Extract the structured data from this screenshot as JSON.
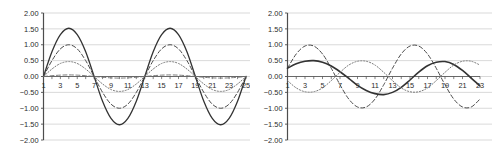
{
  "figure": {
    "background_color": "#ffffff",
    "panel_count": 2
  },
  "chart_data": [
    {
      "id": "left-chart",
      "type": "line",
      "title": "",
      "subtitle": "",
      "xlabel": "",
      "ylabel": "",
      "grid": true,
      "grid_axis": "y",
      "legend": "none",
      "xlim": [
        1,
        25
      ],
      "ylim": [
        -2.0,
        2.0
      ],
      "yticks": [
        2.0,
        1.5,
        1.0,
        0.5,
        0.0,
        -0.5,
        -1.0,
        -1.5,
        -2.0
      ],
      "ytick_labels": [
        "2.00",
        "1.50",
        "1.00",
        "0.50",
        "0.00",
        "-0.50",
        "-1.00",
        "-1.50",
        "-2.00"
      ],
      "xticks": [
        1,
        3,
        5,
        7,
        9,
        11,
        13,
        15,
        17,
        19,
        21,
        23,
        25
      ],
      "xtick_labels": [
        "1",
        "3",
        "5",
        "7",
        "9",
        "11",
        "13",
        "15",
        "17",
        "19",
        "21",
        "23",
        "25"
      ],
      "x": [
        1,
        2,
        3,
        4,
        5,
        6,
        7,
        8,
        9,
        10,
        11,
        12,
        13,
        14,
        15,
        16,
        17,
        18,
        19,
        20,
        21,
        22,
        23,
        24,
        25
      ],
      "series": [
        {
          "name": "series-1-solid",
          "style": "solid",
          "color": "#333333",
          "width": 1.3,
          "amplitude": 1.53,
          "values": [
            0.0,
            0.78,
            1.32,
            1.52,
            1.32,
            0.78,
            0.0,
            -0.78,
            -1.32,
            -1.52,
            -1.32,
            -0.78,
            0.0,
            0.78,
            1.32,
            1.52,
            1.32,
            0.78,
            0.0,
            -0.78,
            -1.32,
            -1.52,
            -1.32,
            -0.78,
            0.0
          ]
        },
        {
          "name": "series-2-dashed",
          "style": "dashed",
          "color": "#4a4a4a",
          "width": 1.0,
          "amplitude": 1.0,
          "values": [
            0.0,
            0.5,
            0.87,
            1.0,
            0.87,
            0.5,
            0.0,
            -0.5,
            -0.87,
            -1.0,
            -0.87,
            -0.5,
            0.0,
            0.5,
            0.87,
            1.0,
            0.87,
            0.5,
            0.0,
            -0.5,
            -0.87,
            -1.0,
            -0.87,
            -0.5,
            0.0
          ]
        },
        {
          "name": "series-3-dotted",
          "style": "dotted",
          "color": "#777777",
          "width": 1.0,
          "amplitude": 0.47,
          "values": [
            0.0,
            0.235,
            0.41,
            0.47,
            0.41,
            0.235,
            0.0,
            -0.235,
            -0.41,
            -0.47,
            -0.41,
            -0.235,
            0.0,
            0.235,
            0.41,
            0.47,
            0.41,
            0.235,
            0.0,
            -0.235,
            -0.41,
            -0.47,
            -0.41,
            -0.235,
            0.0
          ]
        },
        {
          "name": "series-4-flat-dashed",
          "style": "dashed",
          "color": "#6e6e6e",
          "width": 0.9,
          "amplitude": 0.05,
          "values": [
            0.0,
            0.025,
            0.043,
            0.05,
            0.043,
            0.025,
            0.0,
            -0.025,
            -0.043,
            -0.05,
            -0.043,
            -0.025,
            0.0,
            0.025,
            0.043,
            0.05,
            0.043,
            0.025,
            0.0,
            -0.025,
            -0.043,
            -0.05,
            -0.043,
            -0.025,
            0.0
          ]
        }
      ]
    },
    {
      "id": "right-chart",
      "type": "line",
      "title": "",
      "subtitle": "",
      "xlabel": "",
      "ylabel": "",
      "grid": true,
      "grid_axis": "y",
      "legend": "none",
      "xlim": [
        1,
        23
      ],
      "ylim": [
        -2.0,
        2.0
      ],
      "yticks": [
        2.0,
        1.5,
        1.0,
        0.5,
        0.0,
        -0.5,
        -1.0,
        -1.5,
        -2.0
      ],
      "ytick_labels": [
        "2.00",
        "1.50",
        "1.00",
        "0.50",
        "0.00",
        "-0.50",
        "-1.00",
        "-1.50",
        "-2.00"
      ],
      "xticks": [
        1,
        3,
        5,
        7,
        9,
        11,
        13,
        15,
        17,
        19,
        21,
        23
      ],
      "xtick_labels": [
        "1",
        "3",
        "5",
        "7",
        "9",
        "11",
        "13",
        "15",
        "17",
        "19",
        "21",
        "23"
      ],
      "x": [
        1,
        2,
        3,
        4,
        5,
        6,
        7,
        8,
        9,
        10,
        11,
        12,
        13,
        14,
        15,
        16,
        17,
        18,
        19,
        20,
        21,
        22,
        23
      ],
      "series": [
        {
          "name": "series-1-dashed",
          "style": "dashed",
          "color": "#4a4a4a",
          "width": 1.0,
          "amplitude": 1.0,
          "values": [
            0.26,
            0.71,
            0.96,
            0.96,
            0.71,
            0.26,
            -0.26,
            -0.71,
            -0.96,
            -0.96,
            -0.71,
            -0.26,
            0.26,
            0.71,
            0.96,
            0.96,
            0.71,
            0.26,
            -0.26,
            -0.71,
            -0.96,
            -0.96,
            -0.71
          ]
        },
        {
          "name": "series-2-solid",
          "style": "solid",
          "color": "#333333",
          "width": 1.6,
          "amplitude": 0.5,
          "values": [
            0.26,
            0.4,
            0.48,
            0.5,
            0.45,
            0.33,
            0.15,
            -0.06,
            -0.28,
            -0.44,
            -0.54,
            -0.57,
            -0.5,
            -0.34,
            -0.11,
            0.14,
            0.34,
            0.45,
            0.47,
            0.38,
            0.19,
            -0.05,
            -0.3
          ]
        },
        {
          "name": "series-3-dotted",
          "style": "dotted",
          "color": "#7a7a7a",
          "width": 1.0,
          "amplitude": 0.5,
          "values": [
            -0.13,
            -0.36,
            -0.48,
            -0.48,
            -0.36,
            -0.13,
            0.13,
            0.36,
            0.48,
            0.48,
            0.36,
            0.13,
            -0.13,
            -0.36,
            -0.48,
            -0.48,
            -0.36,
            -0.13,
            0.13,
            0.36,
            0.48,
            0.48,
            0.36
          ]
        }
      ]
    }
  ]
}
